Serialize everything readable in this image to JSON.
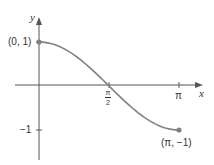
{
  "chart_data": {
    "type": "line",
    "title": "",
    "xlabel": "x",
    "ylabel": "y",
    "function": "y = cos(x), 0 ≤ x ≤ π",
    "x": [
      0,
      0.3927,
      0.7854,
      1.1781,
      1.5708,
      1.9635,
      2.3562,
      2.7489,
      3.1416
    ],
    "series": [
      {
        "name": "cos x",
        "values": [
          1,
          0.9239,
          0.7071,
          0.3827,
          0,
          -0.3827,
          -0.7071,
          -0.9239,
          -1
        ]
      }
    ],
    "xlim": [
      0,
      3.1416
    ],
    "ylim": [
      -1,
      1
    ],
    "x_ticks": [
      {
        "value": 1.5708,
        "label_num": "π",
        "label_den": "2"
      },
      {
        "value": 3.1416,
        "label": "π"
      }
    ],
    "y_ticks": [
      {
        "value": -1,
        "label": "−1"
      }
    ],
    "annotations": [
      {
        "point": [
          0,
          1
        ],
        "label": "(0, 1)"
      },
      {
        "point": [
          3.1416,
          -1
        ],
        "label": "(π, −1)"
      }
    ],
    "grid": false,
    "colors": {
      "curve": "#808080",
      "axes": "#555555",
      "endpoint": "#808080"
    }
  },
  "labels": {
    "x_axis": "x",
    "y_axis": "y",
    "start_point": "(0, 1)",
    "end_point": "(π, −1)",
    "tick_pi": "π",
    "tick_half_pi_num": "π",
    "tick_half_pi_den": "2",
    "tick_neg_one": "−1"
  }
}
